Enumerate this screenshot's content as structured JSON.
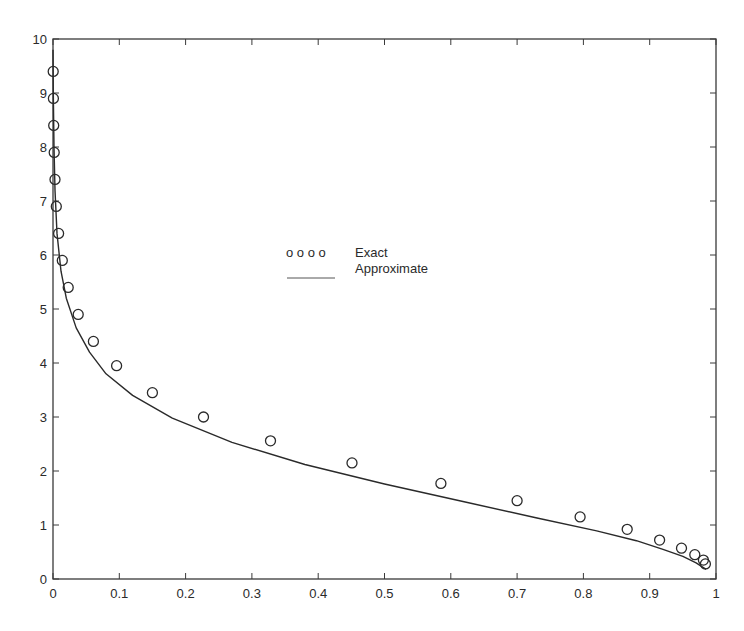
{
  "chart_data": {
    "type": "line",
    "title": "",
    "xlabel": "",
    "ylabel": "",
    "xlim": [
      0,
      1
    ],
    "ylim": [
      0,
      10
    ],
    "grid": false,
    "legend_position": "center",
    "x_ticks": [
      "0",
      "0.1",
      "0.2",
      "0.3",
      "0.4",
      "0.5",
      "0.6",
      "0.7",
      "0.8",
      "0.9",
      "1"
    ],
    "y_ticks": [
      "0",
      "1",
      "2",
      "3",
      "4",
      "5",
      "6",
      "7",
      "8",
      "9",
      "10"
    ],
    "series": [
      {
        "name": "Exact",
        "style": "markers",
        "marker": "circle",
        "x": [
          0.0003,
          0.0006,
          0.001,
          0.0018,
          0.003,
          0.005,
          0.0085,
          0.014,
          0.023,
          0.038,
          0.061,
          0.096,
          0.15,
          0.227,
          0.328,
          0.451,
          0.585,
          0.7,
          0.795,
          0.866,
          0.915,
          0.948,
          0.968,
          0.981
        ],
        "y": [
          9.4,
          8.9,
          8.4,
          7.9,
          7.4,
          6.9,
          6.4,
          5.9,
          5.4,
          4.9,
          4.4,
          3.9,
          3.4,
          2.9,
          2.4,
          1.9,
          1.4,
          0.9,
          0.4,
          -0.1,
          -0.6,
          -1.1,
          -1.6,
          -2.1
        ]
      },
      {
        "name": "Approximate",
        "style": "line",
        "x": [
          0.0,
          0.0005,
          0.0015,
          0.003,
          0.006,
          0.012,
          0.02,
          0.035,
          0.055,
          0.08,
          0.12,
          0.18,
          0.27,
          0.38,
          0.5,
          0.62,
          0.73,
          0.82,
          0.88,
          0.92,
          0.95,
          0.97,
          0.985
        ],
        "y": [
          9.8,
          9.0,
          8.0,
          7.2,
          6.4,
          5.7,
          5.2,
          4.65,
          4.2,
          3.8,
          3.4,
          2.98,
          2.53,
          2.12,
          1.76,
          1.43,
          1.13,
          0.89,
          0.71,
          0.55,
          0.42,
          0.3,
          0.18
        ]
      }
    ],
    "exact_points_display": {
      "x": [
        0.0003,
        0.0006,
        0.001,
        0.0018,
        0.003,
        0.005,
        0.0085,
        0.014,
        0.023,
        0.038,
        0.061,
        0.096,
        0.15,
        0.227,
        0.328,
        0.451,
        0.585,
        0.7,
        0.795,
        0.866,
        0.915,
        0.948,
        0.968,
        0.981
      ],
      "y": [
        9.4,
        8.9,
        8.4,
        7.9,
        7.4,
        6.9,
        6.4,
        5.9,
        5.4,
        4.9,
        4.4,
        3.95,
        3.45,
        3.0,
        2.56,
        2.15,
        1.77,
        1.45,
        1.15,
        0.92,
        0.72,
        0.57,
        0.45,
        0.35
      ]
    },
    "exact_points_extra": {
      "x": [
        0.984
      ],
      "y": [
        0.28
      ]
    }
  },
  "legend": {
    "items": [
      {
        "symbol": "o o o o",
        "label": "Exact"
      },
      {
        "symbol": "line",
        "label": "Approximate"
      }
    ]
  },
  "colors": {
    "axis": "#3a3a3a",
    "line": "#2a2a2a",
    "marker": "#2a2a2a",
    "background": "#ffffff"
  }
}
